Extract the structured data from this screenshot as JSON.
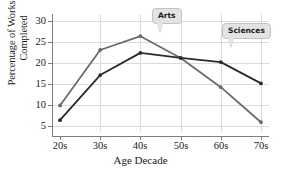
{
  "chart_data": {
    "type": "line",
    "title": "",
    "xlabel": "Age Decade",
    "ylabel": "Percentage of Works Completed",
    "ylabel_line1": "Percentage of Works",
    "ylabel_line2": "Completed",
    "categories": [
      "20s",
      "30s",
      "40s",
      "50s",
      "60s",
      "70s"
    ],
    "xticks": [
      "20s",
      "30s",
      "40s",
      "50s",
      "60s",
      "70s"
    ],
    "yticks": [
      5,
      10,
      15,
      20,
      25,
      30
    ],
    "ylim": [
      2.5,
      31
    ],
    "grid": true,
    "legend": "callout-labels",
    "series": [
      {
        "name": "Arts",
        "color": "#6b6b6b",
        "marker": "circle",
        "values": [
          9.8,
          23.1,
          26.4,
          21.2,
          14.2,
          5.8
        ]
      },
      {
        "name": "Sciences",
        "color": "#2b2b2b",
        "marker": "circle",
        "values": [
          6.3,
          17.1,
          22.4,
          21.2,
          20.2,
          15.1
        ]
      }
    ],
    "annotations": [
      {
        "text": "Arts",
        "series": "Arts",
        "points_to_category": "40s"
      },
      {
        "text": "Sciences",
        "series": "Sciences",
        "points_to_category": "60s"
      }
    ],
    "colors": {
      "arts_line": "#6b6b6b",
      "sciences_line": "#2b2b2b",
      "gridline": "#dcdcdc",
      "axis": "#7d7d7d",
      "callout_fill": "#e3e3e3",
      "callout_border": "#c2c2c2",
      "background": "#ffffff",
      "text": "#1a1a1a"
    }
  }
}
